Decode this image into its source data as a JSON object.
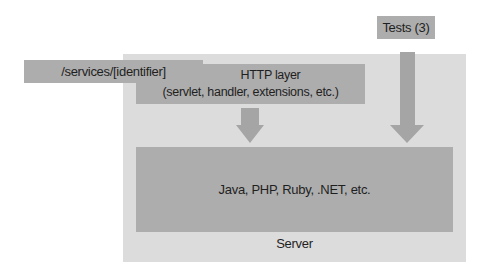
{
  "diagram": {
    "server_label": "Server",
    "services_box": {
      "label": "/services/[identifier]"
    },
    "http_layer": {
      "title": "HTTP layer",
      "subtitle": "(servlet, handler, extensions, etc.)"
    },
    "tests_box": {
      "label": "Tests (3)"
    },
    "runtime_box": {
      "label": "Java, PHP, Ruby, .NET, etc."
    },
    "arrows": [
      {
        "from": "HTTP layer",
        "to": "Java, PHP, Ruby, .NET, etc."
      },
      {
        "from": "Tests (3)",
        "to": "Java, PHP, Ruby, .NET, etc."
      }
    ],
    "colors": {
      "server_background": "#dcdcdc",
      "box_fill": "#adadad",
      "arrow_fill": "#a5a5a5",
      "text": "#1f1f1f"
    }
  }
}
